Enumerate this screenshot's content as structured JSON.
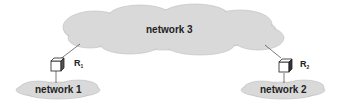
{
  "diagram": {
    "clouds": [
      {
        "id": "network3",
        "label": "network 3"
      },
      {
        "id": "network1",
        "label": "network 1"
      },
      {
        "id": "network2",
        "label": "network 2"
      }
    ],
    "routers": [
      {
        "id": "R1",
        "label": "R",
        "subscript": "1",
        "connects": [
          "network 1",
          "network 3"
        ]
      },
      {
        "id": "R2",
        "label": "R",
        "subscript": "2",
        "connects": [
          "network 2",
          "network 3"
        ]
      }
    ],
    "colors": {
      "cloud_fill": "#d9d9d9",
      "cloud_stroke": "#b8b8b8",
      "line": "#444444"
    }
  }
}
